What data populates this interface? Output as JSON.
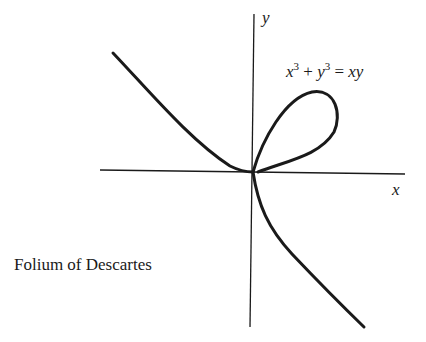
{
  "figure": {
    "title": "Folium of Descartes",
    "equation": {
      "lhs_a": "x",
      "lhs_a_exp": "3",
      "plus": " + ",
      "lhs_b": "y",
      "lhs_b_exp": "3",
      "rel": " = ",
      "rhs": "xy"
    },
    "axes": {
      "x_label": "x",
      "y_label": "y"
    },
    "colors": {
      "curve": "#1a1a1a",
      "axis": "#1a1a1a",
      "background": "#ffffff"
    }
  }
}
